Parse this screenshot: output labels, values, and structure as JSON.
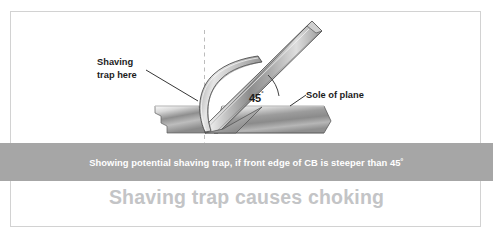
{
  "figure": {
    "title_caption": "Shaving trap causes choking",
    "banner_caption": "Showing potential shaving trap, if front edge of CB is steeper than 45˚",
    "annotations": {
      "shaving_trap_line1": "Shaving",
      "shaving_trap_line2": "trap here",
      "sole_of_plane": "Sole of plane",
      "angle_value": "45",
      "angle_degree_symbol": "˚"
    },
    "colors": {
      "banner_bg": "#a6a6a6",
      "banner_text": "#ffffff",
      "caption_text": "#c3c4c6",
      "border": "#d2d2d2",
      "page_bg": "#ffffff",
      "metal_light": "#f2f2f2",
      "metal_mid": "#9a9a9a",
      "metal_dark": "#6e6e6e",
      "outline": "#3a3a3a",
      "dashed_line": "#b9b9b9"
    },
    "icon_names": {
      "blade": "plane-blade-icon",
      "chipbreaker": "chipbreaker-curve-icon",
      "sole": "plane-sole-icon",
      "workpiece": "workpiece-block-icon",
      "centerline": "dashed-centerline-icon",
      "angle_arc": "angle-arc-icon",
      "leader_shaving": "leader-line-shaving-trap-icon",
      "leader_sole": "leader-line-sole-icon"
    }
  }
}
